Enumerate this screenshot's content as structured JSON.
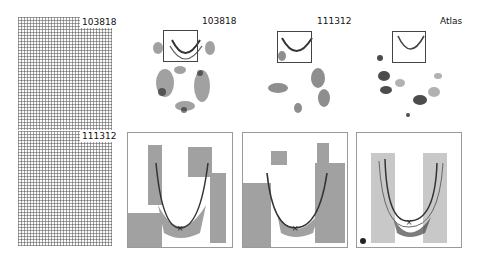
{
  "figure": {
    "grid_panels": [
      {
        "label": "103818"
      },
      {
        "label": "111312"
      }
    ],
    "overview_panels": [
      {
        "label": "103818"
      },
      {
        "label": "111312"
      },
      {
        "label": "Atlas"
      }
    ],
    "zoom_panels": [
      {
        "subject": "103818",
        "marker": "×"
      },
      {
        "subject": "111312",
        "marker": "×"
      },
      {
        "subject": "Atlas",
        "marker": "×"
      }
    ],
    "colors": {
      "ink": "#222222",
      "frame": "#9a9a9a",
      "grid": "#5a5a5a"
    }
  }
}
